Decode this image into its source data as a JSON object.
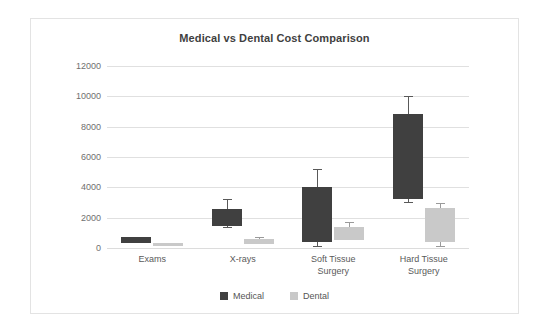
{
  "card": {
    "title": "Medical vs Dental Cost Comparison"
  },
  "chart_data": {
    "type": "bar",
    "subtype": "floating-range-bar-with-error-bars",
    "title": "Medical vs Dental Cost Comparison",
    "xlabel": "",
    "ylabel": "",
    "ylim": [
      0,
      12000
    ],
    "ytick_step": 2000,
    "yticks": [
      "12000",
      "10000",
      "8000",
      "6000",
      "4000",
      "2000",
      "0"
    ],
    "ytick_values": [
      12000,
      10000,
      8000,
      6000,
      4000,
      2000,
      0
    ],
    "grid": true,
    "legend_position": "bottom-center",
    "categories": [
      "Exams",
      "X-rays",
      "Soft Tissue Surgery",
      "Hard Tissue Surgery"
    ],
    "category_lines": [
      [
        "Exams"
      ],
      [
        "X-rays"
      ],
      [
        "Soft Tissue",
        "Surgery"
      ],
      [
        "Hard Tissue",
        "Surgery"
      ]
    ],
    "series": [
      {
        "name": "Medical",
        "color": "#404040",
        "bar_low": [
          350,
          1450,
          400,
          3250
        ],
        "bar_high": [
          700,
          2600,
          4050,
          8850
        ],
        "err_low": [
          350,
          1400,
          150,
          3050
        ],
        "err_high": [
          700,
          3200,
          5200,
          10000
        ]
      },
      {
        "name": "Dental",
        "color": "#c9c9c9",
        "bar_low": [
          120,
          250,
          500,
          400
        ],
        "bar_high": [
          300,
          620,
          1400,
          2650
        ],
        "err_low": [
          120,
          250,
          500,
          150
        ],
        "err_high": [
          300,
          700,
          1700,
          2950
        ]
      }
    ],
    "legend": [
      "Medical",
      "Dental"
    ]
  },
  "legend": {
    "items": [
      {
        "label": "Medical",
        "color": "#404040"
      },
      {
        "label": "Dental",
        "color": "#c9c9c9"
      }
    ]
  }
}
